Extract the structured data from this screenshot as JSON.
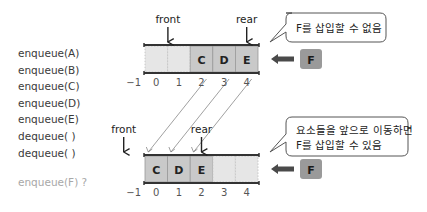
{
  "operations": [
    "enqueue(A)",
    "enqueue(B)",
    "enqueue(C)",
    "enqueue(D)",
    "enqueue(E)",
    "dequeue( )",
    "dequeue( )"
  ],
  "pending_operation": "enqueue(F) ?",
  "index_labels": [
    "-1",
    "0",
    "1",
    "2",
    "3",
    "4"
  ],
  "top_queue": {
    "cells": [
      "",
      "",
      "C",
      "D",
      "E"
    ],
    "front_label": "front",
    "front_index": 1,
    "rear_label": "rear",
    "rear_index": 4,
    "incoming_element": "F",
    "callout": "F를 삽입할 수 없음"
  },
  "bottom_queue": {
    "cells": [
      "C",
      "D",
      "E",
      "",
      ""
    ],
    "front_label": "front",
    "front_index": -1,
    "rear_label": "rear",
    "rear_index": 2,
    "incoming_element": "F",
    "callout_lines": [
      "요소들을 앞으로 이동하면",
      "F를 삽입할 수 있음"
    ]
  },
  "shift_mapping": [
    {
      "from": 2,
      "to": 0
    },
    {
      "from": 3,
      "to": 1
    },
    {
      "from": 4,
      "to": 2
    }
  ],
  "colors": {
    "filled_cell": "#c9c9c9",
    "empty_cell": "#e6e6e6",
    "incoming_box": "#9a9a9a",
    "arrow": "#4a4a4a",
    "pending_text": "#a8a8a8"
  }
}
